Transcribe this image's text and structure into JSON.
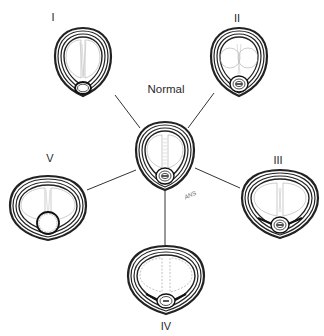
{
  "figure": {
    "center": {
      "id": "normal",
      "label": "Normal"
    },
    "variants": [
      {
        "id": "I",
        "label": "I",
        "esophagus": "empty-lumen"
      },
      {
        "id": "II",
        "label": "II",
        "esophagus": "collapsed-layered"
      },
      {
        "id": "III",
        "label": "III",
        "esophagus": "collapsed-layered"
      },
      {
        "id": "IV",
        "label": "IV",
        "esophagus": "collapsed-layered"
      },
      {
        "id": "V",
        "label": "V",
        "esophagus": "distended-round"
      }
    ],
    "signature": "ANS"
  },
  "colors": {
    "ink": "#222222",
    "faint": "#9a9a9a",
    "background": "#ffffff"
  }
}
